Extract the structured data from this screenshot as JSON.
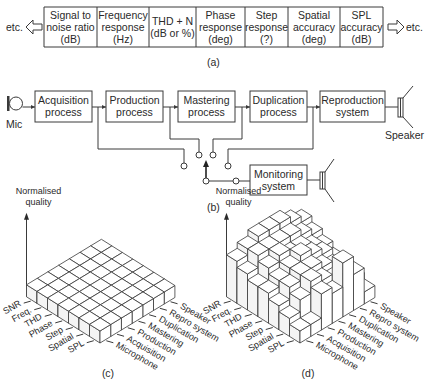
{
  "table_a": {
    "left_more": "etc.",
    "right_more": "etc.",
    "columns": [
      {
        "lines": [
          "Signal to",
          "noise ratio",
          "(dB)"
        ]
      },
      {
        "lines": [
          "Frequency",
          "response",
          "(Hz)"
        ]
      },
      {
        "lines": [
          "THD + N",
          "(dB or %)"
        ]
      },
      {
        "lines": [
          "Phase",
          "response",
          "(deg)"
        ]
      },
      {
        "lines": [
          "Step",
          "response",
          "(?)"
        ]
      },
      {
        "lines": [
          "Spatial",
          "accuracy",
          "(deg)"
        ]
      },
      {
        "lines": [
          "SPL",
          "accuracy",
          "(dB)"
        ]
      }
    ],
    "caption": "(a)"
  },
  "diagram_b": {
    "mic_label": "Mic",
    "speaker_label": "Speaker",
    "blocks": [
      {
        "lines": [
          "Acquisition",
          "process"
        ]
      },
      {
        "lines": [
          "Production",
          "process"
        ]
      },
      {
        "lines": [
          "Mastering",
          "process"
        ]
      },
      {
        "lines": [
          "Duplication",
          "process"
        ]
      },
      {
        "lines": [
          "Reproduction",
          "system"
        ]
      }
    ],
    "monitor": {
      "lines": [
        "Monitoring",
        "system"
      ]
    },
    "caption": "(b)"
  },
  "chart_data": [
    {
      "type": "bar3d",
      "title": "",
      "zlabel": "Normalised quality",
      "row_labels": [
        "SNR",
        "Freq.",
        "THD",
        "Phase",
        "Step",
        "Spatial",
        "SPL"
      ],
      "col_labels": [
        "Microphone",
        "Acquisition",
        "Production",
        "Mastering",
        "Duplication",
        "Repro system",
        "Speaker"
      ],
      "values": [
        [
          1,
          1,
          1,
          1,
          1,
          1,
          1
        ],
        [
          1,
          1,
          1,
          1,
          1,
          1,
          1
        ],
        [
          1,
          1,
          1,
          1,
          1,
          1,
          1
        ],
        [
          1,
          1,
          1,
          1,
          1,
          1,
          1
        ],
        [
          1,
          1,
          1,
          1,
          1,
          1,
          1
        ],
        [
          1,
          1,
          1,
          1,
          1,
          1,
          1
        ],
        [
          1,
          1,
          1,
          1,
          1,
          1,
          1
        ]
      ],
      "zlim": [
        0,
        5
      ],
      "caption": "(c)"
    },
    {
      "type": "bar3d",
      "title": "",
      "zlabel": "Normalised quality",
      "row_labels": [
        "SNR",
        "Freq.",
        "THD",
        "Phase",
        "Step",
        "Spatial",
        "SPL"
      ],
      "col_labels": [
        "Microphone",
        "Acquisition",
        "Production",
        "Mastering",
        "Duplication",
        "Repro system",
        "Speaker"
      ],
      "values": [
        [
          3.5,
          4,
          4.5,
          4.5,
          4.5,
          4,
          3.5
        ],
        [
          3,
          4,
          4,
          4,
          4,
          3.5,
          3
        ],
        [
          2.5,
          3.5,
          4,
          3.5,
          3.5,
          3,
          2.5
        ],
        [
          2.5,
          3,
          3.5,
          4,
          3.5,
          3,
          2
        ],
        [
          2,
          3,
          3.5,
          3.5,
          3,
          2.5,
          1.5
        ],
        [
          1.5,
          2.5,
          3.5,
          3,
          2.5,
          2,
          1.5
        ],
        [
          1,
          1,
          3,
          2.5,
          4.5,
          3,
          1
        ]
      ],
      "zlim": [
        0,
        5
      ],
      "caption": "(d)"
    }
  ]
}
